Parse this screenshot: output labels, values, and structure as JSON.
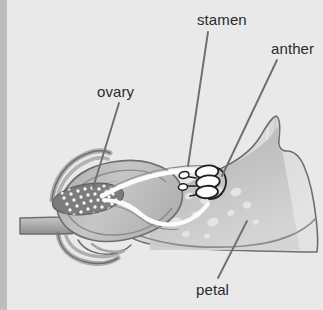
{
  "figure": {
    "background_color": "#e9e9e9",
    "left_margin_strip_color": "#bdbdbd",
    "label_text_color": "#2b2b2b",
    "leader_line_color": "#6e6e6e",
    "outline_color": "#6e6e6e",
    "tissue_fill_light": "#d8d8d8",
    "tissue_fill_mid": "#b8b8b8",
    "tissue_fill_dark": "#8a8a8a",
    "ovary_fill": "#7e7e7e",
    "ovule_color": "#f2f2f2",
    "channel_color": "#fbfbfb",
    "anther_fill": "#fdfdfd",
    "anther_outline": "#1f1f1f",
    "petal_spot_color": "#e2e2e2"
  },
  "labels": [
    {
      "id": "ovary",
      "text": "ovary",
      "x": 97,
      "y": 84,
      "leader": {
        "x1": 119,
        "y1": 103,
        "x2": 93,
        "y2": 188
      }
    },
    {
      "id": "stamen",
      "text": "stamen",
      "x": 197,
      "y": 12,
      "leader": {
        "x1": 208,
        "y1": 32,
        "x2": 188,
        "y2": 166
      }
    },
    {
      "id": "anther",
      "text": "anther",
      "x": 271,
      "y": 41,
      "leader": {
        "x1": 277,
        "y1": 60,
        "x2": 222,
        "y2": 176
      }
    },
    {
      "id": "petal",
      "text": "petal",
      "x": 196,
      "y": 282,
      "leader": {
        "x1": 218,
        "y1": 278,
        "x2": 247,
        "y2": 221
      }
    }
  ],
  "structures": [
    {
      "name": "pedicel",
      "description": "stem stalk entering from left edge"
    },
    {
      "name": "sepals",
      "description": "curved calyx strands above and below receptacle"
    },
    {
      "name": "receptacle",
      "description": "swollen base joining stem to ovary"
    },
    {
      "name": "ovary",
      "description": "dark lens-shaped chamber containing ovules"
    },
    {
      "name": "ovules",
      "description": "cluster of small pale dots inside the ovary",
      "count": 40
    },
    {
      "name": "style",
      "description": "pale tubular channel arcing right from ovary"
    },
    {
      "name": "filament",
      "description": "pale channels branching to the anthers"
    },
    {
      "name": "anthers",
      "description": "stack of white discs outlined in black",
      "count": 4
    },
    {
      "name": "petal",
      "description": "large pale wing-shaped blade with pale oval spots"
    },
    {
      "name": "petal_spots",
      "description": "scattered light oval markings on the petal",
      "count": 16
    }
  ]
}
